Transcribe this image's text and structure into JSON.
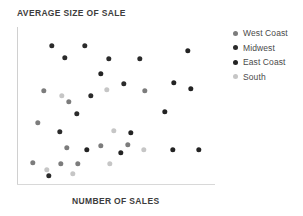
{
  "chart_data": {
    "type": "scatter",
    "title": "AVERAGE SIZE OF SALE",
    "xlabel": "NUMBER OF SALES",
    "ylabel": "AVERAGE SIZE OF SALE",
    "grid": false,
    "legend_position": "right",
    "xlim": [
      0,
      100
    ],
    "ylim": [
      0,
      100
    ],
    "axis_ticks": [],
    "series": [
      {
        "name": "West Coast",
        "color": "#7c7c7c",
        "points": [
          {
            "x": 13.6,
            "y": 59.5
          },
          {
            "x": 26.3,
            "y": 52.5
          },
          {
            "x": 10.6,
            "y": 39.2
          },
          {
            "x": 25.3,
            "y": 23.4
          },
          {
            "x": 8.1,
            "y": 13.9
          },
          {
            "x": 42.4,
            "y": 24.7
          },
          {
            "x": 30.8,
            "y": 13.3
          },
          {
            "x": 22.2,
            "y": 13.3
          },
          {
            "x": 64.6,
            "y": 59.5
          },
          {
            "x": 56.1,
            "y": 25.3
          }
        ]
      },
      {
        "name": "Midwest",
        "color": "#2b2b2b",
        "points": [
          {
            "x": 17.7,
            "y": 88.0
          },
          {
            "x": 34.3,
            "y": 88.0
          },
          {
            "x": 24.2,
            "y": 80.4
          },
          {
            "x": 46.5,
            "y": 79.7
          },
          {
            "x": 62.1,
            "y": 79.7
          },
          {
            "x": 54.0,
            "y": 63.9
          },
          {
            "x": 37.4,
            "y": 56.3
          },
          {
            "x": 30.3,
            "y": 44.9
          },
          {
            "x": 21.7,
            "y": 33.5
          },
          {
            "x": 16.2,
            "y": 5.7
          }
        ]
      },
      {
        "name": "East Coast",
        "color": "#232323",
        "points": [
          {
            "x": 86.4,
            "y": 84.8
          },
          {
            "x": 79.3,
            "y": 64.6
          },
          {
            "x": 87.9,
            "y": 60.8
          },
          {
            "x": 74.7,
            "y": 46.2
          },
          {
            "x": 57.6,
            "y": 32.9
          },
          {
            "x": 52.5,
            "y": 20.3
          },
          {
            "x": 78.8,
            "y": 22.2
          },
          {
            "x": 91.9,
            "y": 22.2
          },
          {
            "x": 42.4,
            "y": 70.3
          },
          {
            "x": 35.4,
            "y": 22.2
          }
        ]
      },
      {
        "name": "South",
        "color": "#c6c6c6",
        "points": [
          {
            "x": 22.7,
            "y": 56.3
          },
          {
            "x": 45.5,
            "y": 60.1
          },
          {
            "x": 49.0,
            "y": 34.2
          },
          {
            "x": 28.3,
            "y": 7.0
          },
          {
            "x": 64.1,
            "y": 22.2
          },
          {
            "x": 15.2,
            "y": 9.5
          },
          {
            "x": 47.0,
            "y": 13.3
          }
        ]
      }
    ]
  },
  "legend": {
    "items": [
      {
        "label": "West Coast",
        "color": "#7c7c7c"
      },
      {
        "label": "Midwest",
        "color": "#2b2b2b"
      },
      {
        "label": "East Coast",
        "color": "#232323"
      },
      {
        "label": "South",
        "color": "#c6c6c6"
      }
    ]
  }
}
